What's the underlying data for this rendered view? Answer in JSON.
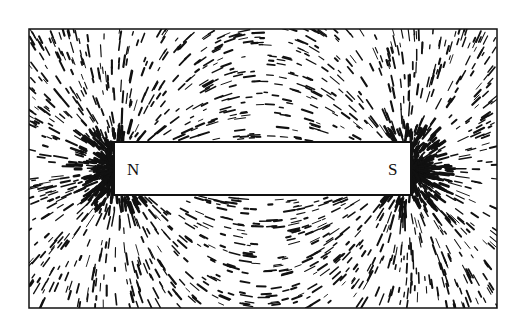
{
  "figure": {
    "frame": {
      "x": 29,
      "y": 29,
      "w": 468,
      "h": 279
    },
    "magnet": {
      "x": 114,
      "y": 142,
      "w": 297,
      "h": 53
    },
    "poles": {
      "north": "N",
      "south": "S"
    },
    "colors": {
      "ink": "#111111",
      "paper": "#ffffff"
    }
  }
}
